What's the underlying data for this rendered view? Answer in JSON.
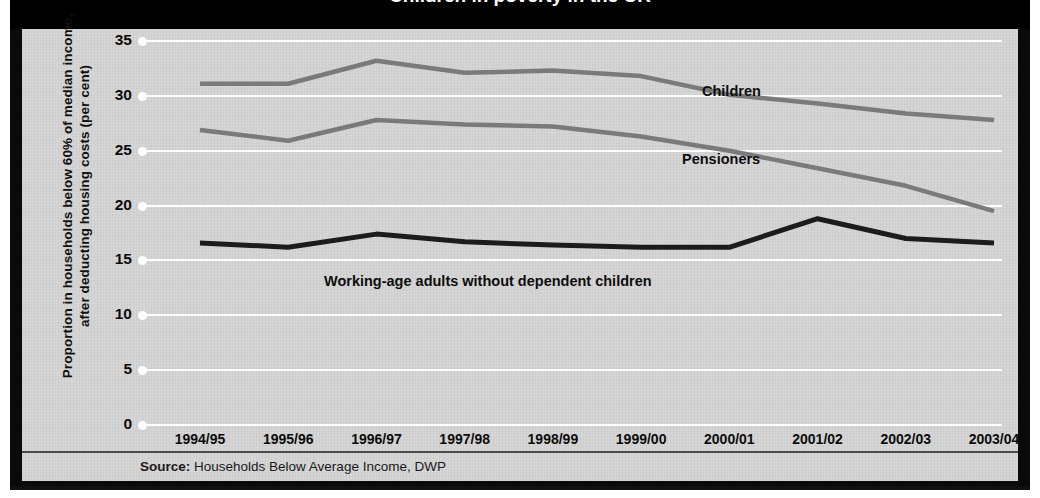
{
  "title": "Children in poverty in the UK",
  "source": {
    "prefix": "Source:",
    "text": "Households Below Average Income, DWP"
  },
  "axis": {
    "ylabel": "Proportion in households below 60% of median income, after deducting housing costs (per cent)",
    "yticks": [
      "35",
      "30",
      "25",
      "20",
      "15",
      "10",
      "5",
      "0"
    ],
    "xticks": [
      "1994/95",
      "1995/96",
      "1996/97",
      "1997/98",
      "1998/99",
      "1999/00",
      "2000/01",
      "2001/02",
      "2002/03",
      "2003/04"
    ]
  },
  "labels": {
    "children": "Children",
    "pensioners": "Pensioners",
    "working_age": "Working-age adults without dependent children"
  },
  "colors": {
    "background": "#d3d3d3",
    "frame": "#0a0a0a",
    "grid": "#fdfdfd",
    "children_line": "#7a7a7a",
    "pensioners_line": "#7a7a7a",
    "working_age_line": "#1c1c1c",
    "text": "#0c0c0c"
  },
  "chart_data": {
    "type": "line",
    "title": "Children in poverty in the UK",
    "xlabel": "",
    "ylabel": "Proportion in households below 60% of median income, after deducting housing costs (per cent)",
    "ylim": [
      0,
      35
    ],
    "yticks": [
      0,
      5,
      10,
      15,
      20,
      25,
      30,
      35
    ],
    "grid": true,
    "legend": "inline-annotations",
    "categories": [
      "1994/95",
      "1995/96",
      "1996/97",
      "1997/98",
      "1998/99",
      "1999/00",
      "2000/01",
      "2001/02",
      "2002/03",
      "2003/04"
    ],
    "series": [
      {
        "name": "Children",
        "color": "#7a7a7a",
        "values": [
          31.1,
          31.1,
          33.2,
          32.1,
          32.3,
          31.8,
          30.1,
          29.3,
          28.4,
          27.8
        ]
      },
      {
        "name": "Pensioners",
        "color": "#7a7a7a",
        "values": [
          26.9,
          25.9,
          27.8,
          27.4,
          27.2,
          26.3,
          25.0,
          23.4,
          21.8,
          19.5
        ]
      },
      {
        "name": "Working-age adults without dependent children",
        "color": "#1c1c1c",
        "values": [
          16.6,
          16.2,
          17.4,
          16.7,
          16.4,
          16.2,
          16.2,
          18.8,
          17.0,
          16.6
        ]
      }
    ]
  }
}
